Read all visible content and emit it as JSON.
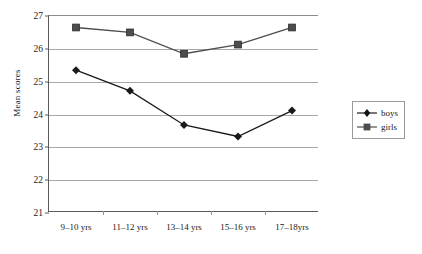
{
  "chart_data": {
    "type": "line",
    "title": "",
    "xlabel": "",
    "ylabel": "Mean scores",
    "categories": [
      "9–10 yrs",
      "11–12 yrs",
      "13–14 yrs",
      "15–16 yrs",
      "17–18yrs"
    ],
    "series": [
      {
        "name": "boys",
        "marker": "diamond",
        "color": "#1a1a1a",
        "values": [
          25.35,
          24.72,
          23.68,
          23.33,
          24.12
        ]
      },
      {
        "name": "girls",
        "marker": "square",
        "color": "#4d4d4d",
        "values": [
          26.65,
          26.5,
          25.85,
          26.13,
          26.65
        ]
      }
    ],
    "ylim": [
      21,
      27
    ],
    "yticks": [
      21,
      22,
      23,
      24,
      25,
      26,
      27
    ],
    "ytick_labels": [
      "21",
      "22",
      "23",
      "24",
      "25",
      "26",
      "27"
    ],
    "grid": true,
    "legend_position": "right"
  },
  "legend": {
    "items": [
      {
        "label": "boys"
      },
      {
        "label": "girls"
      }
    ]
  }
}
